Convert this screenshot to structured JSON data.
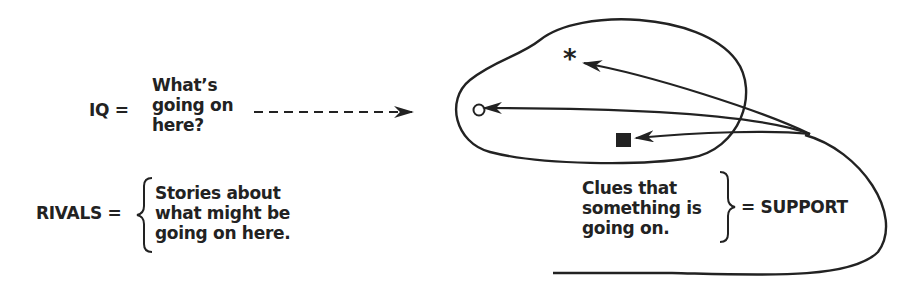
{
  "iq": {
    "label": "IQ =",
    "lines": [
      "What’s",
      "going on",
      "here?"
    ]
  },
  "rivals": {
    "label": "RIVALS =",
    "lines": [
      "Stories about",
      "what might be",
      "going on here."
    ]
  },
  "support": {
    "lines": [
      "Clues that",
      "something is",
      "going on."
    ],
    "label": "= SUPPORT"
  },
  "symbols": [
    "asterisk",
    "open-circle",
    "filled-square"
  ],
  "colors": {
    "ink": "#222222",
    "background": "#ffffff"
  }
}
